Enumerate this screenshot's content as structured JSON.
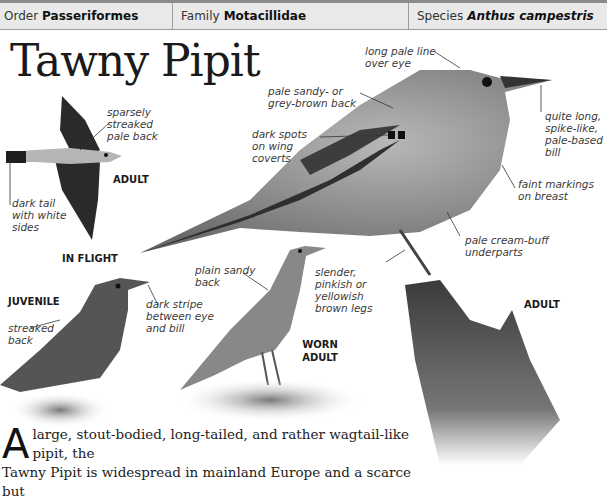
{
  "header": {
    "order": {
      "label": "Order",
      "value": "Passeriformes"
    },
    "family": {
      "label": "Family",
      "value": "Motacillidae"
    },
    "species": {
      "label": "Species",
      "value": "Anthus campestris"
    }
  },
  "title": "Tawny Pipit",
  "figures": {
    "in_flight": {
      "age_label": "ADULT",
      "caption": "IN FLIGHT",
      "labels": {
        "back": "sparsely streaked pale back",
        "tail": "dark tail with white sides"
      }
    },
    "juvenile": {
      "caption": "JUVENILE",
      "labels": {
        "back": "streaked back",
        "eye_stripe": "dark stripe between eye and bill"
      }
    },
    "worn_adult": {
      "caption": "WORN ADULT",
      "labels": {
        "back": "plain sandy back"
      }
    },
    "adult": {
      "caption": "ADULT",
      "labels": {
        "eye_line": "long pale line over eye",
        "back": "pale sandy- or grey-brown back",
        "wing_coverts": "dark spots on wing coverts",
        "bill": "quite long, spike-like, pale-based bill",
        "breast": "faint markings on breast",
        "underparts": "pale cream-buff underparts",
        "legs": "slender, pinkish or yellowish brown legs"
      }
    }
  },
  "body": {
    "dropcap": "A",
    "line1": "large, stout-bodied, long-tailed, and rather wagtail-like pipit, the",
    "line2": "Tawny Pipit is widespread in mainland Europe and a scarce but"
  }
}
